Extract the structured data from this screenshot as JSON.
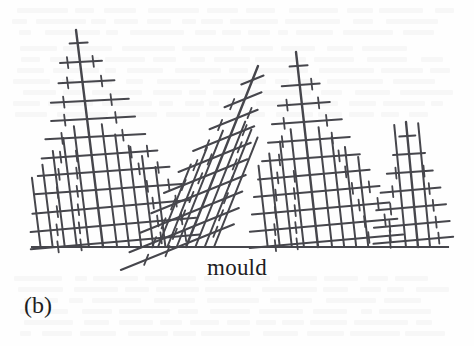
{
  "figure": {
    "panel_label": "(b)",
    "mould_label": "mould",
    "background_color": "#fefefe",
    "line_color": "#46464c",
    "baseline": {
      "name": "mould-surface-line",
      "x1": 32,
      "y1": 247,
      "x2": 448,
      "y2": 247,
      "stroke_width": 2.1
    },
    "scene_description": "columnar dendrites growing upward from a mould wall"
  },
  "chart_data": {
    "type": "diagram",
    "title": "(b)",
    "xlabel": "mould",
    "ylabel": "",
    "grid": false,
    "legend": "none",
    "axis_ranges": {
      "x": [
        0,
        474
      ],
      "y": [
        0,
        346
      ]
    },
    "baseline_y": 247,
    "dendrites": [
      {
        "name": "dendrite-1",
        "trunk": {
          "x1": 103,
          "y1": 247,
          "x2": 76,
          "y2": 30,
          "width": 2.4
        },
        "tilt_deg": -7.1,
        "height_px": 217,
        "primary_branches": [
          {
            "y": 43,
            "left": 8,
            "right": 10,
            "angle": -3
          },
          {
            "y": 62,
            "left": 20,
            "right": 22,
            "angle": -3
          },
          {
            "y": 82,
            "left": 24,
            "right": 32,
            "angle": -3
          },
          {
            "y": 101,
            "left": 34,
            "right": 44,
            "angle": -3
          },
          {
            "y": 119,
            "left": 36,
            "right": 48,
            "angle": -3
          },
          {
            "y": 137,
            "left": 44,
            "right": 56,
            "angle": -3
          },
          {
            "y": 155,
            "left": 50,
            "right": 66,
            "angle": -4
          },
          {
            "y": 172,
            "left": 56,
            "right": 76,
            "angle": -4
          },
          {
            "y": 190,
            "left": 62,
            "right": 86,
            "angle": -4
          },
          {
            "y": 208,
            "left": 66,
            "right": 92,
            "angle": -5
          },
          {
            "y": 226,
            "left": 70,
            "right": 96,
            "angle": -5
          },
          {
            "y": 243,
            "left": 72,
            "right": 98,
            "angle": -5
          }
        ],
        "secondary_arms": [
          14,
          26,
          38,
          50,
          62
        ]
      },
      {
        "name": "dendrite-2",
        "trunk": {
          "x1": 186,
          "y1": 247,
          "x2": 258,
          "y2": 66,
          "width": 2.4
        },
        "tilt_deg": 21.7,
        "height_px": 181,
        "primary_branches": [
          {
            "y": 80,
            "left": 12,
            "right": 12,
            "angle": -22
          },
          {
            "y": 99,
            "left": 22,
            "right": 18,
            "angle": -22
          },
          {
            "y": 118,
            "left": 30,
            "right": 22,
            "angle": -22
          },
          {
            "y": 136,
            "left": 40,
            "right": 26,
            "angle": -22
          },
          {
            "y": 154,
            "left": 48,
            "right": 30,
            "angle": -22
          },
          {
            "y": 172,
            "left": 56,
            "right": 34,
            "angle": -22
          },
          {
            "y": 190,
            "left": 62,
            "right": 40,
            "angle": -22
          },
          {
            "y": 208,
            "left": 66,
            "right": 44,
            "angle": -22
          },
          {
            "y": 226,
            "left": 70,
            "right": 48,
            "angle": -22
          },
          {
            "y": 243,
            "left": 72,
            "right": 50,
            "angle": -22
          }
        ],
        "secondary_arms": [
          12,
          24,
          36
        ]
      },
      {
        "name": "dendrite-3",
        "trunk": {
          "x1": 318,
          "y1": 247,
          "x2": 296,
          "y2": 52,
          "width": 2.4
        },
        "tilt_deg": -6.4,
        "height_px": 195,
        "primary_branches": [
          {
            "y": 66,
            "left": 8,
            "right": 10,
            "angle": -4
          },
          {
            "y": 85,
            "left": 18,
            "right": 20,
            "angle": -4
          },
          {
            "y": 104,
            "left": 24,
            "right": 28,
            "angle": -4
          },
          {
            "y": 122,
            "left": 32,
            "right": 38,
            "angle": -4
          },
          {
            "y": 140,
            "left": 38,
            "right": 44,
            "angle": -4
          },
          {
            "y": 158,
            "left": 46,
            "right": 52,
            "angle": -4
          },
          {
            "y": 175,
            "left": 52,
            "right": 60,
            "angle": -5
          },
          {
            "y": 192,
            "left": 58,
            "right": 68,
            "angle": -5
          },
          {
            "y": 209,
            "left": 62,
            "right": 76,
            "angle": -5
          },
          {
            "y": 226,
            "left": 66,
            "right": 82,
            "angle": -5
          },
          {
            "y": 242,
            "left": 68,
            "right": 86,
            "angle": -5
          }
        ],
        "secondary_arms": [
          14,
          26,
          38,
          50
        ]
      },
      {
        "name": "dendrite-4",
        "trunk": {
          "x1": 418,
          "y1": 247,
          "x2": 406,
          "y2": 122,
          "width": 2.4
        },
        "tilt_deg": -5.5,
        "height_px": 125,
        "primary_branches": [
          {
            "y": 136,
            "left": 8,
            "right": 8,
            "angle": -4
          },
          {
            "y": 154,
            "left": 16,
            "right": 16,
            "angle": -4
          },
          {
            "y": 172,
            "left": 24,
            "right": 22,
            "angle": -4
          },
          {
            "y": 190,
            "left": 32,
            "right": 28,
            "angle": -5
          },
          {
            "y": 207,
            "left": 38,
            "right": 32,
            "angle": -5
          },
          {
            "y": 224,
            "left": 42,
            "right": 34,
            "angle": -5
          },
          {
            "y": 240,
            "left": 44,
            "right": 36,
            "angle": -5
          }
        ],
        "secondary_arms": [
          12,
          24
        ]
      }
    ]
  }
}
